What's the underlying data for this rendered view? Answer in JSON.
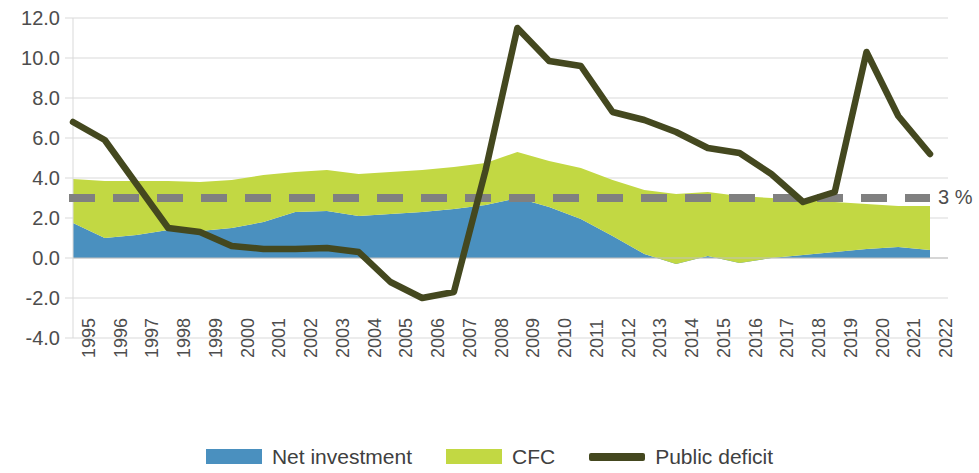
{
  "chart_data": {
    "type": "area",
    "title": "",
    "xlabel": "",
    "ylabel": "",
    "ylim": [
      -4.0,
      12.0
    ],
    "ytick_step": 2.0,
    "grid": true,
    "legend_position": "bottom",
    "categories": [
      "1995",
      "1996",
      "1997",
      "1998",
      "1999",
      "2000",
      "2001",
      "2002",
      "2003",
      "2004",
      "2005",
      "2006",
      "2007",
      "2008",
      "2009",
      "2010",
      "2011",
      "2012",
      "2013",
      "2014",
      "2015",
      "2016",
      "2017",
      "2018",
      "2019",
      "2020",
      "2021",
      "2022"
    ],
    "ytick_labels": [
      "12.0",
      "10.0",
      "8.0",
      "6.0",
      "4.0",
      "2.0",
      "0.0",
      "-2.0",
      "-4.0"
    ],
    "ytick_values": [
      12.0,
      10.0,
      8.0,
      6.0,
      4.0,
      2.0,
      0.0,
      -2.0,
      -4.0
    ],
    "series": [
      {
        "name": "Net investment",
        "type": "stacked-area",
        "color": "#4a90bf",
        "values": [
          1.75,
          1.0,
          1.15,
          1.4,
          1.35,
          1.5,
          1.8,
          2.3,
          2.35,
          2.1,
          2.2,
          2.3,
          2.45,
          2.65,
          3.0,
          2.55,
          1.95,
          1.1,
          0.2,
          -0.3,
          0.1,
          -0.25,
          0.0,
          0.15,
          0.3,
          0.45,
          0.55,
          0.4
        ]
      },
      {
        "name": "CFC",
        "type": "stacked-area",
        "color": "#c2d843",
        "values": [
          2.2,
          2.85,
          2.7,
          2.45,
          2.45,
          2.4,
          2.35,
          2.0,
          2.05,
          2.1,
          2.1,
          2.1,
          2.1,
          2.1,
          2.3,
          2.3,
          2.55,
          2.8,
          3.2,
          3.5,
          3.2,
          3.35,
          3.0,
          2.75,
          2.5,
          2.25,
          2.05,
          2.2
        ]
      },
      {
        "name": "Public deficit",
        "type": "line",
        "color": "#44481f",
        "values": [
          6.8,
          5.9,
          3.7,
          1.5,
          1.3,
          0.6,
          0.45,
          0.45,
          0.5,
          0.3,
          -1.2,
          -2.0,
          -1.7,
          4.4,
          11.5,
          9.85,
          9.6,
          7.3,
          6.9,
          6.3,
          5.5,
          5.25,
          4.2,
          2.8,
          3.3,
          10.3,
          7.1,
          5.2
        ]
      }
    ],
    "reference_line": {
      "name": "3 %",
      "value": 3.0,
      "label": "3 %",
      "color": "#808080",
      "style": "dashed"
    }
  },
  "legend": {
    "items": [
      {
        "label": "Net investment",
        "marker": "square",
        "color": "#4a90bf"
      },
      {
        "label": "CFC",
        "marker": "square",
        "color": "#c2d843"
      },
      {
        "label": "Public deficit",
        "marker": "line",
        "color": "#44481f"
      }
    ]
  }
}
